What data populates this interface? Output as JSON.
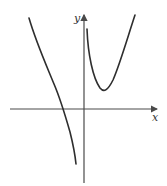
{
  "diagram": {
    "type": "function-graph",
    "axes": {
      "x_label": "x",
      "y_label": "y",
      "x_axis": {
        "x1": 10,
        "x2": 157,
        "y": 109
      },
      "y_axis": {
        "x": 84,
        "y1": 183,
        "y2": 15
      }
    },
    "curves": [
      {
        "name": "left-branch",
        "description": "Decreasing branch left of y-axis, crossing x-axis at negative x, descending toward vertical asymptote",
        "path": "M29,18 C36,42 45,62 54,84 C60,98 66,118 70,132 C73,144 75,154 76,164"
      },
      {
        "name": "right-branch",
        "description": "U-shaped branch right of y-axis with local minimum above x-axis",
        "path": "M87,29 C88,55 93,78 100,88 C104,93 108,90 113,80 C120,64 128,36 135,15"
      }
    ],
    "colors": {
      "axis": "#4a4a4a",
      "curve": "#2e2e2e",
      "background": "#ffffff"
    }
  }
}
